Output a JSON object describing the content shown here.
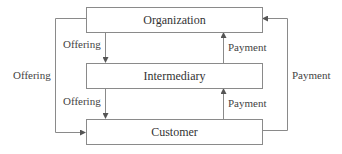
{
  "diagram": {
    "type": "flow",
    "nodes": [
      {
        "id": "organization",
        "label": "Organization"
      },
      {
        "id": "intermediary",
        "label": "Intermediary"
      },
      {
        "id": "customer",
        "label": "Customer"
      }
    ],
    "edges": [
      {
        "from": "organization",
        "to": "intermediary",
        "label": "Offering"
      },
      {
        "from": "intermediary",
        "to": "customer",
        "label": "Offering"
      },
      {
        "from": "organization",
        "to": "customer",
        "label": "Offering",
        "route": "outer-left"
      },
      {
        "from": "intermediary",
        "to": "organization",
        "label": "Payment"
      },
      {
        "from": "customer",
        "to": "intermediary",
        "label": "Payment"
      },
      {
        "from": "customer",
        "to": "organization",
        "label": "Payment",
        "route": "outer-right"
      }
    ],
    "colors": {
      "line": "#8a8a8a",
      "text": "#444444"
    }
  }
}
